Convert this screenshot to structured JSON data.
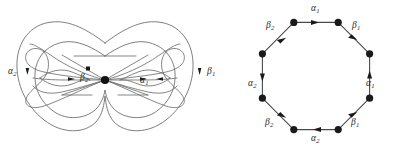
{
  "figure": {
    "background_color": "#ffffff",
    "curve_color": "#6f6f6f",
    "edge_color": "#4a4a4a",
    "vertex_color": "#1a1a1a",
    "label_color": "#2b2b2b"
  },
  "surface": {
    "name": "genus-two-surface",
    "basepoint_label": "",
    "labels": [
      {
        "id": "surface-label-alpha2",
        "text": "α",
        "sub": "2",
        "x": 8,
        "y": 67
      },
      {
        "id": "surface-label-beta2",
        "text": "β",
        "sub": "2",
        "x": 80,
        "y": 73
      },
      {
        "id": "surface-label-alpha1",
        "text": "α",
        "sub": "1",
        "x": 140,
        "y": 76
      },
      {
        "id": "surface-label-beta1",
        "text": "β",
        "sub": "1",
        "x": 207,
        "y": 67
      }
    ]
  },
  "octagon": {
    "name": "fundamental-octagon",
    "vertex_count": 8,
    "edges": [
      {
        "id": "octagon-edge-top",
        "label": "α",
        "sub": "1",
        "direction": "right",
        "label_x": 311,
        "label_y": 4
      },
      {
        "id": "octagon-edge-upper-right",
        "label": "β",
        "sub": "1",
        "direction": "down-right",
        "label_x": 352,
        "label_y": 21
      },
      {
        "id": "octagon-edge-right",
        "label": "α",
        "sub": "1",
        "direction": "up",
        "label_x": 366,
        "label_y": 79
      },
      {
        "id": "octagon-edge-lower-right",
        "label": "β",
        "sub": "1",
        "direction": "up-right",
        "label_x": 351,
        "label_y": 118
      },
      {
        "id": "octagon-edge-bottom",
        "label": "α",
        "sub": "2",
        "direction": "left",
        "label_x": 311,
        "label_y": 134
      },
      {
        "id": "octagon-edge-lower-left",
        "label": "β",
        "sub": "2",
        "direction": "down-right",
        "label_x": 265,
        "label_y": 118
      },
      {
        "id": "octagon-edge-left",
        "label": "α",
        "sub": "2",
        "direction": "down",
        "label_x": 248,
        "label_y": 79
      },
      {
        "id": "octagon-edge-upper-left",
        "label": "β",
        "sub": "2",
        "direction": "up-right",
        "label_x": 266,
        "label_y": 21
      }
    ]
  }
}
